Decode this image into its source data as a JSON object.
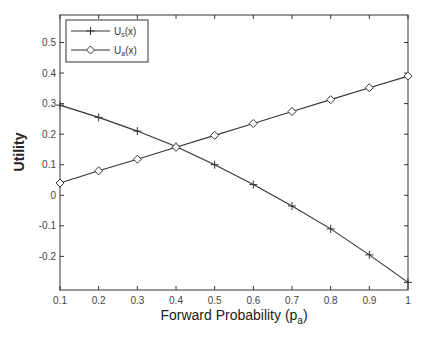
{
  "chart_data": {
    "type": "line",
    "title": "",
    "xlabel": "Forward Probability (p_a)",
    "xlabel_main": "Forward Probability (p",
    "xlabel_sub": "a",
    "xlabel_close": ")",
    "ylabel": "Utility",
    "xlim": [
      0.1,
      1.0
    ],
    "ylim": [
      -0.31,
      0.59
    ],
    "xticks": [
      0.1,
      0.2,
      0.3,
      0.4,
      0.5,
      0.6,
      0.7,
      0.8,
      0.9,
      1
    ],
    "xtick_labels": [
      "0.1",
      "0.2",
      "0.3",
      "0.4",
      "0.5",
      "0.6",
      "0.7",
      "0.8",
      "0.9",
      "1"
    ],
    "yticks": [
      -0.2,
      -0.1,
      0,
      0.1,
      0.2,
      0.3,
      0.4,
      0.5
    ],
    "ytick_labels": [
      "-0.2",
      "-0.1",
      "0",
      "0.1",
      "0.2",
      "0.3",
      "0.4",
      "0.5"
    ],
    "grid": false,
    "legend_position": "upper left",
    "x": [
      0.1,
      0.2,
      0.3,
      0.4,
      0.5,
      0.6,
      0.7,
      0.8,
      0.9,
      1.0
    ],
    "series": [
      {
        "name": "U_s(x)",
        "label_main": "U",
        "label_sub": "s",
        "label_tail": "(x)",
        "marker": "plus",
        "color": "#333333",
        "values": [
          0.295,
          0.255,
          0.21,
          0.16,
          0.1,
          0.035,
          -0.035,
          -0.11,
          -0.195,
          -0.285
        ]
      },
      {
        "name": "U_a(x)",
        "label_main": "U",
        "label_sub": "a",
        "label_tail": "(x)",
        "marker": "diamond",
        "color": "#333333",
        "values": [
          0.04,
          0.08,
          0.118,
          0.157,
          0.196,
          0.235,
          0.274,
          0.313,
          0.352,
          0.39
        ]
      }
    ]
  }
}
